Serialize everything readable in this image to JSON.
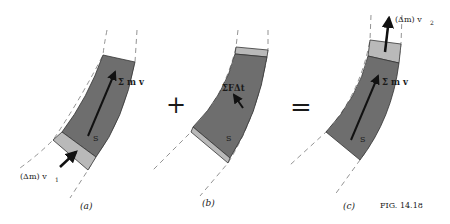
{
  "figure": {
    "caption": "FIG. 14.18",
    "colors": {
      "dark_segment": "#6e6e6e",
      "light_segment": "#b9b9b9",
      "outline": "#333333",
      "arrow": "#111111",
      "dashed_line": "#777777"
    }
  },
  "panels": [
    {
      "id": "a",
      "caption": "(a)",
      "labels": {
        "momentum": "Σ m v",
        "system": "S",
        "mass_in": "(Δm) v",
        "mass_in_sub": "1"
      }
    },
    {
      "id": "b",
      "caption": "(b)",
      "labels": {
        "impulse": "ΣFΔt",
        "system": "S"
      }
    },
    {
      "id": "c",
      "caption": "(c)",
      "labels": {
        "momentum": "Σ m v",
        "system": "S",
        "mass_out": "(Δm) v",
        "mass_out_sub": "2"
      }
    }
  ],
  "operators": {
    "plus": "+",
    "equals": "="
  }
}
